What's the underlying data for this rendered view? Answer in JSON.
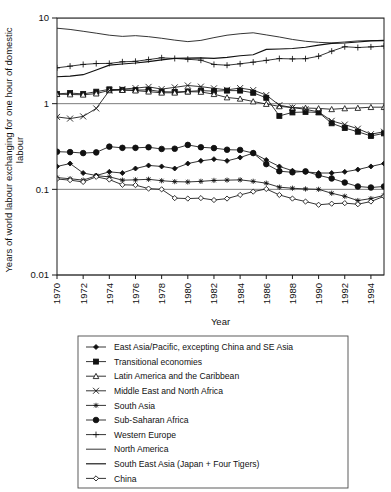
{
  "figure": {
    "background": "#ffffff",
    "ink_color": "#111111",
    "grid_color": "#6e6e6e"
  },
  "chart_data": {
    "type": "line",
    "title": "",
    "subtitle": "",
    "xlabel": "Year",
    "ylabel": "Years of world labour exchanging for one hour of domestic labour",
    "yscale": "log",
    "ylim": [
      0.01,
      10
    ],
    "xlim": [
      1970,
      1995
    ],
    "grid": true,
    "grid_lines_y": [
      10,
      1,
      0.1,
      0.01
    ],
    "legend_position": "below-plot",
    "ytick_labels": [
      "10",
      "1",
      "0.1",
      "0.01"
    ],
    "ytick_values": [
      10,
      1,
      0.1,
      0.01
    ],
    "xtick_labels": [
      "1970",
      "1972",
      "1974",
      "1976",
      "1978",
      "1980",
      "1982",
      "1984",
      "1986",
      "1988",
      "1990",
      "1992",
      "1994"
    ],
    "xtick_values": [
      1970,
      1972,
      1974,
      1976,
      1978,
      1980,
      1982,
      1984,
      1986,
      1988,
      1990,
      1992,
      1994
    ],
    "x": [
      1970,
      1971,
      1972,
      1973,
      1974,
      1975,
      1976,
      1977,
      1978,
      1979,
      1980,
      1981,
      1982,
      1983,
      1984,
      1985,
      1986,
      1987,
      1988,
      1989,
      1990,
      1991,
      1992,
      1993,
      1994,
      1995
    ],
    "series": [
      {
        "name": "East Asia/Pacific, excepting China and SE Asia",
        "marker": "filled-diamond",
        "values": [
          0.185,
          0.2,
          0.155,
          0.145,
          0.16,
          0.155,
          0.175,
          0.19,
          0.185,
          0.175,
          0.2,
          0.215,
          0.225,
          0.215,
          0.235,
          0.265,
          0.22,
          0.185,
          0.165,
          0.16,
          0.155,
          0.155,
          0.16,
          0.17,
          0.185,
          0.2
        ]
      },
      {
        "name": "Transitional economies",
        "marker": "filled-square",
        "values": [
          1.3,
          1.33,
          1.3,
          1.38,
          1.47,
          1.45,
          1.44,
          1.45,
          1.38,
          1.37,
          1.39,
          1.42,
          1.4,
          1.42,
          1.42,
          1.34,
          1.17,
          0.72,
          0.79,
          0.8,
          0.79,
          0.59,
          0.52,
          0.47,
          0.42,
          0.45
        ]
      },
      {
        "name": "Latin America and the Caribbean",
        "marker": "open-triangle",
        "values": [
          1.29,
          1.28,
          1.27,
          1.31,
          1.43,
          1.44,
          1.42,
          1.38,
          1.34,
          1.34,
          1.38,
          1.37,
          1.29,
          1.18,
          1.14,
          1.06,
          0.99,
          0.93,
          0.9,
          0.89,
          0.88,
          0.86,
          0.88,
          0.89,
          0.91,
          0.91
        ]
      },
      {
        "name": "Middle East and North Africa",
        "marker": "x-cross",
        "values": [
          0.7,
          0.67,
          0.71,
          0.88,
          1.42,
          1.48,
          1.52,
          1.57,
          1.48,
          1.55,
          1.63,
          1.58,
          1.51,
          1.45,
          1.52,
          1.44,
          1.26,
          0.96,
          0.9,
          0.86,
          0.8,
          0.63,
          0.57,
          0.51,
          0.44,
          0.47
        ]
      },
      {
        "name": "South Asia",
        "marker": "asterisk",
        "values": [
          0.137,
          0.133,
          0.128,
          0.144,
          0.14,
          0.128,
          0.129,
          0.131,
          0.126,
          0.123,
          0.122,
          0.124,
          0.127,
          0.128,
          0.129,
          0.124,
          0.118,
          0.106,
          0.103,
          0.101,
          0.1,
          0.09,
          0.083,
          0.074,
          0.078,
          0.085
        ]
      },
      {
        "name": "Sub-Saharan Africa",
        "marker": "filled-circle",
        "values": [
          0.275,
          0.272,
          0.265,
          0.27,
          0.315,
          0.305,
          0.305,
          0.31,
          0.296,
          0.298,
          0.33,
          0.31,
          0.303,
          0.29,
          0.288,
          0.265,
          0.197,
          0.163,
          0.158,
          0.162,
          0.146,
          0.134,
          0.12,
          0.108,
          0.105,
          0.108
        ]
      },
      {
        "name": "Western Europe",
        "marker": "plus",
        "values": [
          2.62,
          2.74,
          2.87,
          2.94,
          2.95,
          3.08,
          3.12,
          3.27,
          3.43,
          3.37,
          3.3,
          3.22,
          2.87,
          2.81,
          2.92,
          3.05,
          3.2,
          3.36,
          3.33,
          3.35,
          3.58,
          4.1,
          4.62,
          4.52,
          4.6,
          4.7
        ]
      },
      {
        "name": "North America",
        "marker": "line",
        "values": [
          7.6,
          7.35,
          7.0,
          6.65,
          6.3,
          6.1,
          6.22,
          6.05,
          5.8,
          5.52,
          5.3,
          5.48,
          5.9,
          6.3,
          6.55,
          6.72,
          6.35,
          6.0,
          5.62,
          5.35,
          5.2,
          5.12,
          5.25,
          5.4,
          5.45,
          5.42
        ]
      },
      {
        "name": "South East Asia (Japan + Four Tigers)",
        "marker": "line-thick",
        "values": [
          2.06,
          2.1,
          2.18,
          2.47,
          2.82,
          2.9,
          2.98,
          3.1,
          3.25,
          3.38,
          3.4,
          3.42,
          3.38,
          3.47,
          3.62,
          3.72,
          4.3,
          4.35,
          4.4,
          4.55,
          4.82,
          5.05,
          5.1,
          5.25,
          5.4,
          5.48
        ]
      },
      {
        "name": "China",
        "marker": "open-diamond",
        "values": [
          0.132,
          0.128,
          0.122,
          0.14,
          0.13,
          0.113,
          0.112,
          0.102,
          0.1,
          0.079,
          0.078,
          0.079,
          0.075,
          0.078,
          0.086,
          0.094,
          0.101,
          0.086,
          0.078,
          0.072,
          0.066,
          0.068,
          0.069,
          0.067,
          0.072,
          0.083
        ]
      }
    ]
  },
  "legend": {
    "items": [
      {
        "label": "East Asia/Pacific, excepting China and SE Asia",
        "marker": "filled-diamond"
      },
      {
        "label": "Transitional economies",
        "marker": "filled-square"
      },
      {
        "label": "Latin America and the Caribbean",
        "marker": "open-triangle"
      },
      {
        "label": "Middle East and North Africa",
        "marker": "x-cross"
      },
      {
        "label": "South Asia",
        "marker": "asterisk"
      },
      {
        "label": "Sub-Saharan Africa",
        "marker": "filled-circle"
      },
      {
        "label": "Western Europe",
        "marker": "plus"
      },
      {
        "label": "North America",
        "marker": "line"
      },
      {
        "label": "South East Asia (Japan + Four Tigers)",
        "marker": "line-thick"
      },
      {
        "label": "China",
        "marker": "open-diamond"
      }
    ]
  }
}
